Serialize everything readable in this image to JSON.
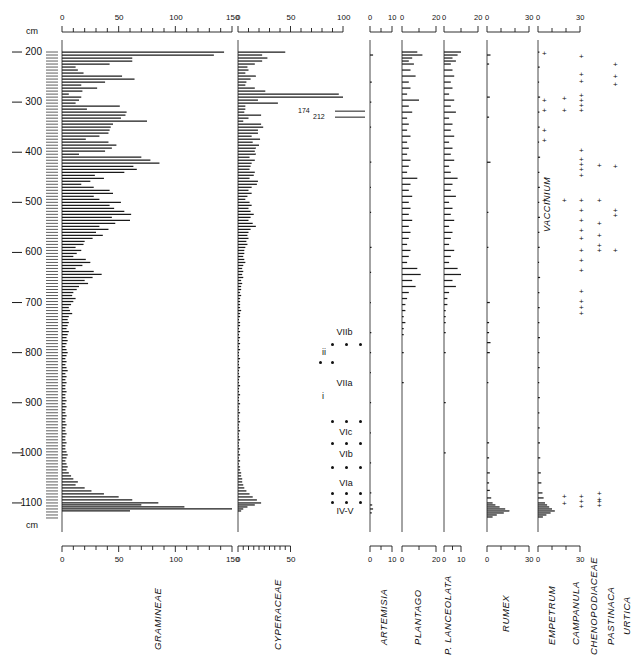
{
  "figure": {
    "type": "pollen-diagram",
    "units_label_top": "cm",
    "units_label_bottom": "cm"
  },
  "depth_axis": {
    "label": "cm",
    "unit": "cm",
    "ticks": [
      200,
      300,
      400,
      500,
      600,
      700,
      800,
      900,
      1000,
      1100
    ],
    "min": 180,
    "max": 1150
  },
  "annotations": [
    {
      "text": "174",
      "taxon": "CYPERACEAE",
      "depth": 318
    },
    {
      "text": "212",
      "taxon": "CYPERACEAE",
      "depth": 330
    }
  ],
  "zones": {
    "labels": [
      "VIIb",
      "ii",
      "VIIa",
      "i",
      "VIc",
      "VIb",
      "VIa",
      "IV-V"
    ],
    "entries": [
      {
        "label": "VIIb",
        "depth": 760,
        "align": "center"
      },
      {
        "label": "ii",
        "depth": 800,
        "align": "left"
      },
      {
        "label": "VIIa",
        "depth": 862,
        "align": "center"
      },
      {
        "label": "i",
        "depth": 888,
        "align": "left"
      },
      {
        "label": "VIc",
        "depth": 960,
        "align": "center"
      },
      {
        "label": "VIb",
        "depth": 1005,
        "align": "center"
      },
      {
        "label": "VIa",
        "depth": 1062,
        "align": "center"
      },
      {
        "label": "IV-V",
        "depth": 1118,
        "align": "center"
      }
    ],
    "dot_rows": [
      783,
      820,
      938,
      982,
      1030,
      1082,
      1100
    ]
  },
  "chart_data": [
    {
      "type": "bar",
      "title": "GRAMINEAE",
      "xlabel": "",
      "ylabel": "cm",
      "orientation": "horizontal",
      "xlim": [
        0,
        150
      ],
      "axis_ticks_major": [
        0,
        50,
        100,
        150
      ],
      "axis_tick_step": 10,
      "grid": false,
      "x": [
        200,
        206,
        212,
        218,
        224,
        230,
        236,
        242,
        248,
        254,
        260,
        266,
        272,
        278,
        284,
        290,
        296,
        302,
        308,
        314,
        320,
        326,
        332,
        338,
        344,
        350,
        356,
        362,
        368,
        374,
        380,
        386,
        392,
        398,
        404,
        410,
        416,
        422,
        428,
        434,
        440,
        446,
        452,
        458,
        464,
        470,
        476,
        482,
        488,
        494,
        500,
        506,
        512,
        518,
        524,
        530,
        536,
        542,
        548,
        554,
        560,
        566,
        572,
        578,
        584,
        590,
        596,
        602,
        608,
        614,
        620,
        626,
        632,
        638,
        644,
        650,
        656,
        662,
        668,
        674,
        680,
        686,
        692,
        698,
        704,
        710,
        716,
        722,
        728,
        734,
        740,
        746,
        752,
        758,
        764,
        770,
        776,
        782,
        788,
        794,
        800,
        806,
        812,
        818,
        824,
        830,
        836,
        842,
        848,
        854,
        860,
        866,
        872,
        878,
        884,
        890,
        896,
        902,
        908,
        914,
        920,
        926,
        932,
        938,
        944,
        950,
        956,
        962,
        968,
        974,
        980,
        986,
        992,
        998,
        1004,
        1010,
        1016,
        1022,
        1028,
        1034,
        1040,
        1046,
        1052,
        1058,
        1064,
        1070,
        1076,
        1082,
        1088,
        1094,
        1100,
        1104,
        1108,
        1112,
        1116,
        1120,
        1124,
        1128
      ],
      "values": [
        143,
        134,
        62,
        62,
        42,
        12,
        14,
        19,
        53,
        64,
        38,
        17,
        31,
        18,
        6,
        17,
        15,
        12,
        51,
        22,
        57,
        56,
        52,
        75,
        45,
        43,
        42,
        41,
        33,
        21,
        41,
        48,
        44,
        38,
        15,
        70,
        78,
        86,
        63,
        66,
        55,
        29,
        37,
        25,
        17,
        28,
        42,
        45,
        28,
        33,
        52,
        42,
        46,
        55,
        61,
        44,
        60,
        47,
        33,
        41,
        30,
        36,
        27,
        20,
        19,
        12,
        17,
        13,
        10,
        21,
        25,
        18,
        12,
        28,
        35,
        27,
        20,
        23,
        15,
        13,
        10,
        9,
        12,
        10,
        8,
        6,
        7,
        9,
        6,
        5,
        6,
        5,
        4,
        6,
        5,
        4,
        5,
        4,
        3,
        4,
        5,
        4,
        3,
        4,
        3,
        4,
        5,
        3,
        4,
        3,
        4,
        3,
        3,
        4,
        3,
        3,
        4,
        3,
        4,
        3,
        3,
        4,
        3,
        3,
        4,
        3,
        3,
        4,
        3,
        3,
        4,
        3,
        3,
        4,
        5,
        4,
        3,
        4,
        5,
        4,
        6,
        8,
        10,
        14,
        12,
        20,
        26,
        37,
        50,
        62,
        85,
        70,
        108,
        150,
        60
      ]
    },
    {
      "type": "bar",
      "title": "CYPERACEAE",
      "xlabel": "",
      "ylabel": "",
      "orientation": "horizontal",
      "xlim": [
        0,
        50
      ],
      "axis_ticks_major_top": [
        0,
        50,
        100
      ],
      "axis_ticks_major_bottom": [
        0,
        50
      ],
      "axis_tick_step": 5,
      "grid": false,
      "x": [
        200,
        206,
        212,
        218,
        224,
        230,
        236,
        242,
        248,
        254,
        260,
        266,
        272,
        278,
        284,
        290,
        296,
        302,
        308,
        314,
        320,
        326,
        332,
        338,
        344,
        350,
        356,
        362,
        368,
        374,
        380,
        386,
        392,
        398,
        404,
        410,
        416,
        422,
        428,
        434,
        440,
        446,
        452,
        458,
        464,
        470,
        476,
        482,
        488,
        494,
        500,
        506,
        512,
        518,
        524,
        530,
        536,
        542,
        548,
        554,
        560,
        566,
        572,
        578,
        584,
        590,
        596,
        602,
        608,
        614,
        620,
        626,
        632,
        638,
        644,
        650,
        656,
        662,
        668,
        674,
        680,
        686,
        692,
        698,
        704,
        710,
        716,
        722,
        728,
        734,
        740,
        746,
        752,
        758,
        764,
        770,
        776,
        782,
        788,
        794,
        800,
        806,
        812,
        818,
        824,
        830,
        836,
        842,
        848,
        854,
        860,
        866,
        872,
        878,
        884,
        890,
        896,
        902,
        908,
        914,
        920,
        926,
        932,
        938,
        944,
        950,
        956,
        962,
        968,
        974,
        980,
        986,
        992,
        998,
        1004,
        1010,
        1016,
        1022,
        1028,
        1034,
        1040,
        1046,
        1052,
        1058,
        1064,
        1070,
        1076,
        1082,
        1088,
        1094,
        1100,
        1104,
        1108,
        1112,
        1116,
        1120,
        1124,
        1128
      ],
      "values": [
        45,
        23,
        28,
        23,
        16,
        9,
        10,
        7,
        17,
        12,
        8,
        7,
        16,
        26,
        96,
        100,
        19,
        38,
        7,
        7,
        6,
        22,
        10,
        5,
        22,
        24,
        19,
        19,
        13,
        21,
        14,
        20,
        17,
        16,
        17,
        11,
        16,
        13,
        12,
        11,
        16,
        15,
        11,
        19,
        18,
        13,
        10,
        13,
        9,
        7,
        11,
        13,
        10,
        12,
        15,
        12,
        10,
        14,
        17,
        12,
        10,
        9,
        10,
        8,
        9,
        7,
        6,
        6,
        5,
        6,
        7,
        5,
        4,
        5,
        4,
        5,
        3,
        4,
        3,
        3,
        2,
        3,
        2,
        2,
        2,
        2,
        3,
        2,
        2,
        1,
        2,
        2,
        1,
        2,
        1,
        2,
        1,
        2,
        1,
        2,
        1,
        1,
        2,
        1,
        1,
        2,
        1,
        1,
        2,
        1,
        1,
        2,
        1,
        1,
        2,
        1,
        1,
        2,
        1,
        1,
        2,
        1,
        1,
        2,
        1,
        1,
        2,
        1,
        1,
        2,
        1,
        1,
        2,
        1,
        2,
        1,
        2,
        1,
        2,
        2,
        3,
        3,
        4,
        4,
        5,
        6,
        8,
        11,
        14,
        18,
        22,
        16,
        9,
        5,
        3
      ]
    },
    {
      "type": "bar",
      "title": "ARTEMISIA",
      "orientation": "horizontal",
      "xlim": [
        0,
        10
      ],
      "axis_ticks_major": [
        0,
        10
      ],
      "axis_tick_step": 5,
      "grid": false,
      "x": [
        206,
        260,
        300,
        350,
        420,
        470,
        520,
        590,
        640,
        700,
        760,
        800,
        840,
        900,
        960,
        1020,
        1080,
        1104,
        1112,
        1120
      ],
      "values": [
        1.4,
        0.8,
        0.6,
        0.5,
        0.6,
        0.4,
        0.5,
        0.7,
        0.5,
        0.4,
        0.6,
        0.5,
        0.4,
        0.5,
        0.4,
        0.5,
        0.6,
        1.0,
        1.4,
        0.8
      ]
    },
    {
      "type": "bar",
      "title": "PLANTAGO",
      "orientation": "horizontal",
      "xlim": [
        0,
        20
      ],
      "axis_ticks_major": [
        0,
        20
      ],
      "axis_tick_step": 5,
      "grid": false,
      "x": [
        200,
        206,
        212,
        218,
        224,
        236,
        248,
        260,
        272,
        284,
        296,
        308,
        320,
        332,
        344,
        356,
        368,
        380,
        392,
        404,
        416,
        428,
        440,
        452,
        464,
        476,
        488,
        500,
        512,
        524,
        536,
        548,
        560,
        572,
        584,
        596,
        608,
        620,
        632,
        644,
        656,
        668,
        680,
        692,
        704,
        716,
        728,
        740,
        752,
        764,
        800,
        860
      ],
      "values": [
        9,
        12,
        6,
        4,
        7,
        5,
        8,
        4,
        5,
        3,
        10,
        4,
        6,
        3,
        4,
        3,
        5,
        3,
        4,
        3,
        5,
        4,
        3,
        9,
        5,
        4,
        6,
        4,
        5,
        4,
        6,
        4,
        5,
        4,
        3,
        5,
        4,
        3,
        9,
        11,
        6,
        8,
        4,
        3,
        2,
        2,
        1,
        2,
        1,
        1,
        1,
        1
      ]
    },
    {
      "type": "bar",
      "title": "P. LANCEOLATA",
      "orientation": "horizontal",
      "xlim_top": [
        0,
        20
      ],
      "xlim_bottom": [
        0,
        10
      ],
      "axis_ticks_major_top": [
        0,
        20
      ],
      "axis_ticks_major_bottom": [
        0,
        10
      ],
      "axis_tick_step": 5,
      "grid": false,
      "x": [
        200,
        206,
        212,
        218,
        224,
        236,
        248,
        260,
        272,
        284,
        296,
        308,
        320,
        332,
        344,
        356,
        368,
        380,
        392,
        404,
        416,
        428,
        440,
        452,
        464,
        476,
        488,
        500,
        512,
        524,
        536,
        548,
        560,
        572,
        584,
        596,
        608,
        620,
        632,
        644,
        656,
        668,
        680,
        692,
        704,
        716,
        728,
        740,
        760,
        800,
        900,
        1000
      ],
      "values": [
        10,
        8,
        5,
        7,
        4,
        5,
        6,
        4,
        5,
        3,
        6,
        4,
        7,
        3,
        5,
        4,
        6,
        3,
        5,
        4,
        6,
        3,
        4,
        8,
        5,
        4,
        7,
        3,
        5,
        4,
        6,
        3,
        5,
        4,
        3,
        6,
        4,
        3,
        8,
        10,
        5,
        7,
        3,
        2,
        2,
        1,
        1,
        1,
        1,
        1,
        1,
        1
      ]
    },
    {
      "type": "bar",
      "title": "RUMEX",
      "orientation": "horizontal",
      "xlim": [
        0,
        30
      ],
      "axis_ticks_major": [
        0,
        30
      ],
      "axis_tick_step": 10,
      "grid": false,
      "x": [
        206,
        224,
        290,
        330,
        420,
        520,
        590,
        700,
        740,
        760,
        780,
        800,
        860,
        980,
        1010,
        1040,
        1060,
        1075,
        1090,
        1100,
        1104,
        1108,
        1112,
        1116,
        1120,
        1124,
        1128
      ],
      "values": [
        2.5,
        1.5,
        2.0,
        1.5,
        2.5,
        1.0,
        1.0,
        2.0,
        1.5,
        1.5,
        2.5,
        2.0,
        1.0,
        1.5,
        1.5,
        2.0,
        1.5,
        2.0,
        3.0,
        4.0,
        6.0,
        9.0,
        13.0,
        16.0,
        12.0,
        7.0,
        4.0
      ]
    },
    {
      "type": "bar",
      "title": "EMPETRUM",
      "orientation": "horizontal",
      "xlim": [
        0,
        30
      ],
      "axis_ticks_major": [
        0,
        30
      ],
      "axis_tick_step": 10,
      "grid": false,
      "x": [
        200,
        230,
        260,
        290,
        320,
        350,
        380,
        410,
        440,
        470,
        500,
        530,
        560,
        590,
        620,
        650,
        680,
        710,
        740,
        770,
        800,
        830,
        860,
        890,
        920,
        950,
        980,
        1010,
        1040,
        1060,
        1080,
        1090,
        1100,
        1104,
        1108,
        1112,
        1116,
        1120,
        1124,
        1128
      ],
      "values": [
        1.0,
        1.2,
        0.8,
        1.5,
        1.0,
        1.2,
        0.8,
        1.5,
        1.0,
        1.3,
        0.9,
        1.4,
        1.0,
        1.2,
        0.8,
        1.5,
        1.0,
        1.2,
        1.0,
        1.4,
        1.0,
        1.2,
        0.9,
        1.3,
        1.0,
        1.2,
        1.4,
        1.6,
        2.0,
        2.4,
        3.2,
        4.0,
        5.0,
        6.5,
        8.0,
        10.0,
        12.0,
        9.0,
        6.0,
        3.5
      ]
    },
    {
      "type": "presence",
      "title": "CAMPANULA",
      "marker": "+",
      "depths": [
        296,
        320,
        500,
        1090,
        1104
      ]
    },
    {
      "type": "presence",
      "title": "CHENOPODIACEAE",
      "marker": "+",
      "depths": [
        212,
        248,
        262,
        290,
        300,
        310,
        320,
        400,
        418,
        428,
        438,
        450,
        500,
        520,
        540,
        560,
        575,
        600,
        620,
        640,
        680,
        700,
        712,
        724,
        1090,
        1100,
        1110
      ]
    },
    {
      "type": "presence",
      "title": "PASTINACA",
      "marker": "+",
      "depths": [
        430,
        500,
        545,
        570,
        590,
        600,
        1085,
        1096,
        1100,
        1108
      ]
    },
    {
      "type": "presence",
      "title": "URTICA",
      "marker": "+",
      "depths": [
        228,
        252,
        268,
        432,
        520,
        530,
        600
      ]
    },
    {
      "type": "presence",
      "title": "VACCINIUM",
      "marker": "+",
      "label_in_plot": true,
      "depths": [
        206,
        300,
        320,
        360,
        380,
        500
      ]
    }
  ],
  "taxa_labels": [
    {
      "name": "GRAMINEAE"
    },
    {
      "name": "CYPERACEAE"
    },
    {
      "name": "ARTEMISIA"
    },
    {
      "name": "PLANTAGO"
    },
    {
      "name": "P. LANCEOLATA"
    },
    {
      "name": "RUMEX"
    },
    {
      "name": "EMPETRUM"
    },
    {
      "name": "CAMPANULA"
    },
    {
      "name": "CHENOPODIACEAE"
    },
    {
      "name": "PASTINACA"
    },
    {
      "name": "URTICA"
    },
    {
      "name": "VACCINIUM"
    }
  ],
  "axis_tick_text": {
    "gramineae": [
      "0",
      "50",
      "100",
      "150"
    ],
    "cyperaceae_top": [
      "0",
      "50",
      "100"
    ],
    "cyperaceae_bottom": [
      "0",
      "50"
    ],
    "artemisia": [
      "0",
      "10"
    ],
    "plantago": [
      "0",
      "20"
    ],
    "lanceolata_top": [
      "0",
      "20"
    ],
    "lanceolata_bottom": [
      "0",
      "10"
    ],
    "rumex": [
      "0",
      "30"
    ],
    "empetrum": [
      "0",
      "30"
    ]
  }
}
